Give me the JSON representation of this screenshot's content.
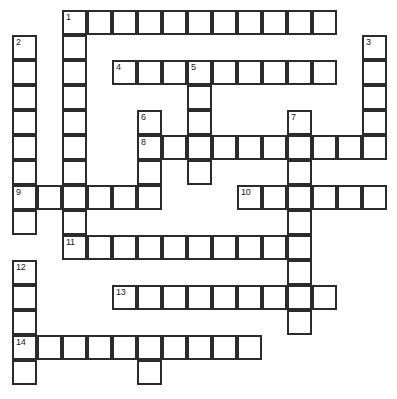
{
  "puzzle": {
    "title": "Crossword Puzzle Grid",
    "type": "crossword-grid",
    "grid": {
      "columns": 16,
      "rows": 15,
      "cell_size_px": 25,
      "origin_x_px": 12,
      "origin_y_px": 10,
      "cell_fill_color": "#ffffff",
      "cell_border_color": "#2b2b2b",
      "background_color": "#ffffff"
    },
    "entries": [
      {
        "number": 1,
        "direction": "across",
        "row": 0,
        "col": 2,
        "length": 11
      },
      {
        "number": 1,
        "direction": "down",
        "row": 0,
        "col": 2,
        "length": 10
      },
      {
        "number": 2,
        "direction": "down",
        "row": 1,
        "col": 0,
        "length": 8
      },
      {
        "number": 3,
        "direction": "down",
        "row": 1,
        "col": 14,
        "length": 5
      },
      {
        "number": 4,
        "direction": "across",
        "row": 2,
        "col": 4,
        "length": 9
      },
      {
        "number": 5,
        "direction": "down",
        "row": 2,
        "col": 7,
        "length": 5
      },
      {
        "number": 6,
        "direction": "down",
        "row": 4,
        "col": 5,
        "length": 3
      },
      {
        "number": 7,
        "direction": "down",
        "row": 4,
        "col": 11,
        "length": 9
      },
      {
        "number": 8,
        "direction": "across",
        "row": 5,
        "col": 5,
        "length": 10
      },
      {
        "number": 9,
        "direction": "across",
        "row": 7,
        "col": 0,
        "length": 6
      },
      {
        "number": 10,
        "direction": "across",
        "row": 7,
        "col": 9,
        "length": 6
      },
      {
        "number": 11,
        "direction": "across",
        "row": 9,
        "col": 2,
        "length": 10
      },
      {
        "number": 12,
        "direction": "down",
        "row": 10,
        "col": 0,
        "length": 5
      },
      {
        "number": 13,
        "direction": "across",
        "row": 11,
        "col": 4,
        "length": 9
      },
      {
        "number": 14,
        "direction": "across",
        "row": 13,
        "col": 0,
        "length": 10
      }
    ],
    "cells": [
      {
        "row": 0,
        "col": 2,
        "number": "1"
      },
      {
        "row": 0,
        "col": 3,
        "number": ""
      },
      {
        "row": 0,
        "col": 4,
        "number": ""
      },
      {
        "row": 0,
        "col": 5,
        "number": ""
      },
      {
        "row": 0,
        "col": 6,
        "number": ""
      },
      {
        "row": 0,
        "col": 7,
        "number": ""
      },
      {
        "row": 0,
        "col": 8,
        "number": ""
      },
      {
        "row": 0,
        "col": 9,
        "number": ""
      },
      {
        "row": 0,
        "col": 10,
        "number": ""
      },
      {
        "row": 0,
        "col": 11,
        "number": ""
      },
      {
        "row": 0,
        "col": 12,
        "number": ""
      },
      {
        "row": 1,
        "col": 0,
        "number": "2"
      },
      {
        "row": 1,
        "col": 2,
        "number": ""
      },
      {
        "row": 1,
        "col": 14,
        "number": "3"
      },
      {
        "row": 2,
        "col": 0,
        "number": ""
      },
      {
        "row": 2,
        "col": 2,
        "number": ""
      },
      {
        "row": 2,
        "col": 4,
        "number": "4"
      },
      {
        "row": 2,
        "col": 5,
        "number": ""
      },
      {
        "row": 2,
        "col": 6,
        "number": ""
      },
      {
        "row": 2,
        "col": 7,
        "number": "5"
      },
      {
        "row": 2,
        "col": 8,
        "number": ""
      },
      {
        "row": 2,
        "col": 9,
        "number": ""
      },
      {
        "row": 2,
        "col": 10,
        "number": ""
      },
      {
        "row": 2,
        "col": 11,
        "number": ""
      },
      {
        "row": 2,
        "col": 12,
        "number": ""
      },
      {
        "row": 2,
        "col": 14,
        "number": ""
      },
      {
        "row": 3,
        "col": 0,
        "number": ""
      },
      {
        "row": 3,
        "col": 2,
        "number": ""
      },
      {
        "row": 3,
        "col": 7,
        "number": ""
      },
      {
        "row": 3,
        "col": 14,
        "number": ""
      },
      {
        "row": 4,
        "col": 0,
        "number": ""
      },
      {
        "row": 4,
        "col": 2,
        "number": ""
      },
      {
        "row": 4,
        "col": 5,
        "number": "6"
      },
      {
        "row": 4,
        "col": 7,
        "number": ""
      },
      {
        "row": 4,
        "col": 11,
        "number": "7"
      },
      {
        "row": 4,
        "col": 14,
        "number": ""
      },
      {
        "row": 5,
        "col": 0,
        "number": ""
      },
      {
        "row": 5,
        "col": 2,
        "number": ""
      },
      {
        "row": 5,
        "col": 5,
        "number": "8"
      },
      {
        "row": 5,
        "col": 6,
        "number": ""
      },
      {
        "row": 5,
        "col": 7,
        "number": ""
      },
      {
        "row": 5,
        "col": 8,
        "number": ""
      },
      {
        "row": 5,
        "col": 9,
        "number": ""
      },
      {
        "row": 5,
        "col": 10,
        "number": ""
      },
      {
        "row": 5,
        "col": 11,
        "number": ""
      },
      {
        "row": 5,
        "col": 12,
        "number": ""
      },
      {
        "row": 5,
        "col": 13,
        "number": ""
      },
      {
        "row": 5,
        "col": 14,
        "number": ""
      },
      {
        "row": 6,
        "col": 0,
        "number": ""
      },
      {
        "row": 6,
        "col": 2,
        "number": ""
      },
      {
        "row": 6,
        "col": 5,
        "number": ""
      },
      {
        "row": 6,
        "col": 7,
        "number": ""
      },
      {
        "row": 6,
        "col": 11,
        "number": ""
      },
      {
        "row": 7,
        "col": 0,
        "number": "9"
      },
      {
        "row": 7,
        "col": 1,
        "number": ""
      },
      {
        "row": 7,
        "col": 2,
        "number": ""
      },
      {
        "row": 7,
        "col": 3,
        "number": ""
      },
      {
        "row": 7,
        "col": 4,
        "number": ""
      },
      {
        "row": 7,
        "col": 5,
        "number": ""
      },
      {
        "row": 7,
        "col": 9,
        "number": "10"
      },
      {
        "row": 7,
        "col": 10,
        "number": ""
      },
      {
        "row": 7,
        "col": 11,
        "number": ""
      },
      {
        "row": 7,
        "col": 12,
        "number": ""
      },
      {
        "row": 7,
        "col": 13,
        "number": ""
      },
      {
        "row": 7,
        "col": 14,
        "number": ""
      },
      {
        "row": 8,
        "col": 0,
        "number": ""
      },
      {
        "row": 8,
        "col": 2,
        "number": ""
      },
      {
        "row": 8,
        "col": 11,
        "number": ""
      },
      {
        "row": 9,
        "col": 2,
        "number": "11"
      },
      {
        "row": 9,
        "col": 3,
        "number": ""
      },
      {
        "row": 9,
        "col": 4,
        "number": ""
      },
      {
        "row": 9,
        "col": 5,
        "number": ""
      },
      {
        "row": 9,
        "col": 6,
        "number": ""
      },
      {
        "row": 9,
        "col": 7,
        "number": ""
      },
      {
        "row": 9,
        "col": 8,
        "number": ""
      },
      {
        "row": 9,
        "col": 9,
        "number": ""
      },
      {
        "row": 9,
        "col": 10,
        "number": ""
      },
      {
        "row": 9,
        "col": 11,
        "number": ""
      },
      {
        "row": 10,
        "col": 0,
        "number": "12"
      },
      {
        "row": 10,
        "col": 11,
        "number": ""
      },
      {
        "row": 11,
        "col": 0,
        "number": ""
      },
      {
        "row": 11,
        "col": 4,
        "number": "13"
      },
      {
        "row": 11,
        "col": 5,
        "number": ""
      },
      {
        "row": 11,
        "col": 6,
        "number": ""
      },
      {
        "row": 11,
        "col": 7,
        "number": ""
      },
      {
        "row": 11,
        "col": 8,
        "number": ""
      },
      {
        "row": 11,
        "col": 9,
        "number": ""
      },
      {
        "row": 11,
        "col": 10,
        "number": ""
      },
      {
        "row": 11,
        "col": 11,
        "number": ""
      },
      {
        "row": 11,
        "col": 12,
        "number": ""
      },
      {
        "row": 12,
        "col": 0,
        "number": ""
      },
      {
        "row": 12,
        "col": 11,
        "number": ""
      },
      {
        "row": 13,
        "col": 0,
        "number": "14"
      },
      {
        "row": 13,
        "col": 1,
        "number": ""
      },
      {
        "row": 13,
        "col": 2,
        "number": ""
      },
      {
        "row": 13,
        "col": 3,
        "number": ""
      },
      {
        "row": 13,
        "col": 4,
        "number": ""
      },
      {
        "row": 13,
        "col": 5,
        "number": ""
      },
      {
        "row": 13,
        "col": 6,
        "number": ""
      },
      {
        "row": 13,
        "col": 7,
        "number": ""
      },
      {
        "row": 13,
        "col": 8,
        "number": ""
      },
      {
        "row": 13,
        "col": 9,
        "number": ""
      },
      {
        "row": 14,
        "col": 0,
        "number": ""
      },
      {
        "row": 14,
        "col": 5,
        "number": ""
      }
    ]
  }
}
